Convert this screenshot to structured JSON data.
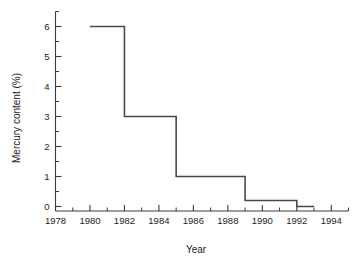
{
  "chart_data": {
    "type": "line",
    "subtype": "step-post",
    "title": "",
    "xlabel": "Year",
    "ylabel": "Mercury content (%)",
    "xlim": [
      1978,
      1995
    ],
    "ylim": [
      -0.15,
      6.5
    ],
    "grid": false,
    "legend": null,
    "x": [
      1980,
      1982,
      1985,
      1989,
      1992,
      1993
    ],
    "values": [
      6,
      3,
      1,
      0.2,
      0,
      0
    ],
    "series": [
      {
        "name": "Mercury content",
        "points": [
          {
            "x": 1980,
            "y": 6
          },
          {
            "x": 1982,
            "y": 6
          },
          {
            "x": 1982,
            "y": 3
          },
          {
            "x": 1985,
            "y": 3
          },
          {
            "x": 1985,
            "y": 1
          },
          {
            "x": 1989,
            "y": 1
          },
          {
            "x": 1989,
            "y": 0.2
          },
          {
            "x": 1992,
            "y": 0.2
          },
          {
            "x": 1992,
            "y": 0
          },
          {
            "x": 1993,
            "y": 0
          }
        ]
      }
    ],
    "xticks": [
      1978,
      1980,
      1982,
      1984,
      1986,
      1988,
      1990,
      1992,
      1994
    ],
    "xtick_labels": [
      "1978",
      "1980",
      "1982",
      "1984",
      "1986",
      "1988",
      "1990",
      "1992",
      "1994"
    ],
    "xminor_ticks": [
      1979,
      1981,
      1983,
      1985,
      1987,
      1989,
      1991,
      1993,
      1995
    ],
    "yticks": [
      0,
      1,
      2,
      3,
      4,
      5,
      6
    ],
    "ytick_labels": [
      "0",
      "1",
      "2",
      "3",
      "4",
      "5",
      "6"
    ],
    "yminor_ticks": [
      0.5,
      1.5,
      2.5,
      3.5,
      4.5,
      5.5,
      6.5
    ],
    "colors": {
      "line": "#4a4a45",
      "axis": "#3a3a38",
      "text": "#1c1c1c",
      "background": "#ffffff"
    }
  }
}
